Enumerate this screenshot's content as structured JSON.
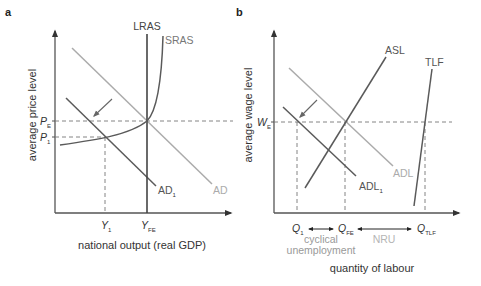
{
  "colors": {
    "dark_curve": "#5a5a5a",
    "light_curve": "#ababab",
    "axis": "#555555",
    "text": "#333333"
  },
  "panel_a": {
    "label": "a",
    "y_axis_title": "average price level",
    "x_axis_title": "national output (real GDP)",
    "curves": {
      "lras": "LRAS",
      "sras": "SRAS",
      "ad": "AD",
      "ad1_main": "AD",
      "ad1_sub": "1"
    },
    "y_ticks": [
      {
        "main": "P",
        "sub": "E"
      },
      {
        "main": "P",
        "sub": "1"
      }
    ],
    "x_ticks": [
      {
        "main": "Y",
        "sub": "1"
      },
      {
        "main": "Y",
        "sub": "FE"
      }
    ]
  },
  "panel_b": {
    "label": "b",
    "y_axis_title": "average wage level",
    "x_axis_title": "quantity of labour",
    "curves": {
      "asl": "ASL",
      "tlf": "TLF",
      "adl": "ADL",
      "adl1_main": "ADL",
      "adl1_sub": "1"
    },
    "y_ticks": [
      {
        "main": "W",
        "sub": "E"
      }
    ],
    "x_ticks": [
      {
        "main": "Q",
        "sub": "1"
      },
      {
        "main": "Q",
        "sub": "FE"
      },
      {
        "main": "Q",
        "sub": "TLF"
      }
    ],
    "annotations": {
      "cyclical_line1": "cyclical",
      "cyclical_line2": "unemployment",
      "nru": "NRU"
    }
  }
}
